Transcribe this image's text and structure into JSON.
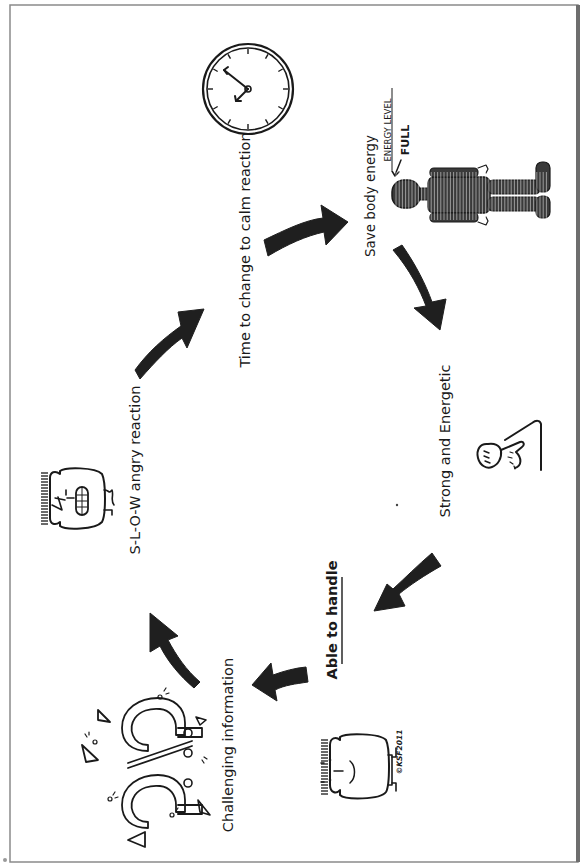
{
  "diagram": {
    "type": "cycle",
    "orientation": "rotated-90-counterclockwise",
    "stages": [
      {
        "id": "challenging",
        "label": "Challenging information",
        "icon": "question-marks-icon"
      },
      {
        "id": "slow-angry",
        "label": "S-L-O-W  angry reaction",
        "icon": "angry-face-icon"
      },
      {
        "id": "time-change",
        "label": "Time to change to calm reaction",
        "icon": "clock-icon"
      },
      {
        "id": "save-energy",
        "label": "Save body energy",
        "icon": "body-energy-icon"
      },
      {
        "id": "strong",
        "label": "Strong and Energetic",
        "icon": "flexed-arm-icon"
      },
      {
        "id": "able",
        "label": "Able to handle",
        "icon": "calm-face-icon"
      }
    ],
    "energy_label": "ENERGY LEVEL",
    "energy_value": "FULL",
    "signature": "©KSF2011",
    "flow": [
      "challenging",
      "slow-angry",
      "time-change",
      "save-energy",
      "strong",
      "able",
      "challenging"
    ]
  },
  "colors": {
    "ink": "#1a1a1a",
    "paper": "#ffffff",
    "frame": "#6e6e6e"
  }
}
